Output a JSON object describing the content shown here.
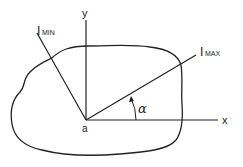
{
  "diagram": {
    "type": "principal-axes-of-area",
    "axes": {
      "x_label": "x",
      "y_label": "y",
      "origin_label": "a"
    },
    "principal_axes": {
      "max_main": "I",
      "max_sub": "MAX",
      "min_main": "I",
      "min_sub": "MIN"
    },
    "angle_label": "α",
    "colors": {
      "stroke": "#222222",
      "background": "#ffffff"
    }
  }
}
